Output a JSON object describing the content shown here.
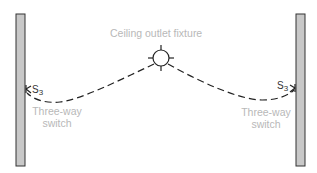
{
  "diagram": {
    "title_label": "Ceiling outlet fixture",
    "left_switch": {
      "symbol": "S",
      "subscript": "3",
      "label_line1": "Three-way",
      "label_line2": "switch"
    },
    "right_switch": {
      "symbol": "S",
      "subscript": "3",
      "label_line1": "Three-way",
      "label_line2": "switch"
    },
    "colors": {
      "wall_fill": "#c8c8c8",
      "wall_stroke": "#333333",
      "wire": "#222222",
      "label": "#b8b8b8"
    }
  }
}
